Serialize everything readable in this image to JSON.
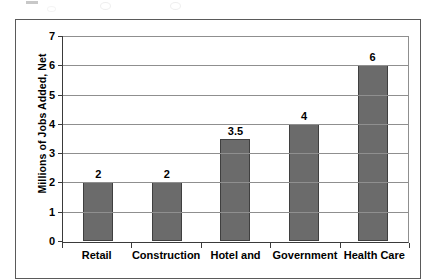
{
  "chart_data": {
    "type": "bar",
    "title": "",
    "xlabel": "",
    "ylabel": "Millions of Jobs Added, Net",
    "categories": [
      "Retail",
      "Construction",
      "Hotel and",
      "Government",
      "Health Care"
    ],
    "values": [
      2,
      2,
      3.5,
      4,
      6
    ],
    "value_labels": [
      "2",
      "2",
      "3.5",
      "4",
      "6"
    ],
    "ylim": [
      0,
      7
    ],
    "ytick_labels": [
      "0",
      "1",
      "2",
      "3",
      "4",
      "5",
      "6",
      "7"
    ],
    "ytick_values": [
      0,
      1,
      2,
      3,
      4,
      5,
      6,
      7
    ],
    "grid": "horizontal",
    "legend": "none",
    "series": [
      {
        "name": "Millions of Jobs Added, Net",
        "values": [
          2,
          2,
          3.5,
          4,
          6
        ]
      }
    ],
    "colors": {
      "bar_fill": "#6b6b6b",
      "bar_outline": "#3f3f3f",
      "gridline": "#8f8f8f",
      "axis": "#3a3a3a",
      "frame": "#5a5a5a",
      "plot_background": "#ffffff",
      "text": "#000000"
    }
  }
}
